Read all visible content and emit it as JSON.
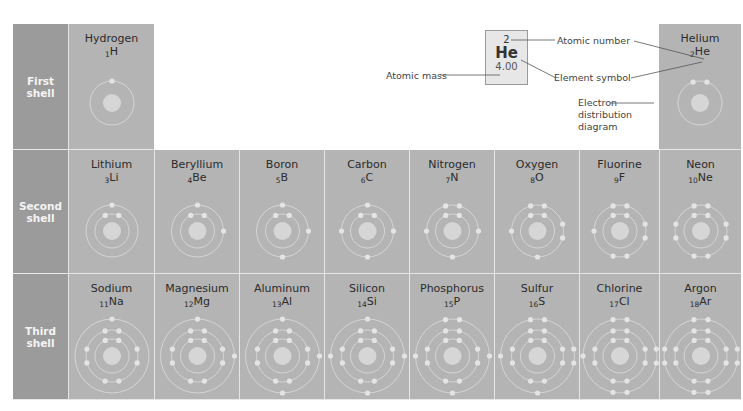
{
  "rows": [
    {
      "label": "First\nshell",
      "label_lines": [
        "First",
        "shell"
      ]
    },
    {
      "label": "Second\nshell",
      "label_lines": [
        "Second",
        "shell"
      ]
    },
    {
      "label": "Third\nshell",
      "label_lines": [
        "Third",
        "shell"
      ]
    }
  ],
  "elements": [
    {
      "name": "Hydrogen",
      "number": "1",
      "symbol": "H",
      "shells": [
        1
      ],
      "row": 0,
      "col": 0
    },
    {
      "name": "Helium",
      "number": "2",
      "symbol": "He",
      "shells": [
        2
      ],
      "row": 0,
      "col": 7
    },
    {
      "name": "Lithium",
      "number": "3",
      "symbol": "Li",
      "shells": [
        2,
        1
      ],
      "row": 1,
      "col": 0
    },
    {
      "name": "Beryllium",
      "number": "4",
      "symbol": "Be",
      "shells": [
        2,
        2
      ],
      "row": 1,
      "col": 1
    },
    {
      "name": "Boron",
      "number": "5",
      "symbol": "B",
      "shells": [
        2,
        3
      ],
      "row": 1,
      "col": 2
    },
    {
      "name": "Carbon",
      "number": "6",
      "symbol": "C",
      "shells": [
        2,
        4
      ],
      "row": 1,
      "col": 3
    },
    {
      "name": "Nitrogen",
      "number": "7",
      "symbol": "N",
      "shells": [
        2,
        5
      ],
      "row": 1,
      "col": 4
    },
    {
      "name": "Oxygen",
      "number": "8",
      "symbol": "O",
      "shells": [
        2,
        6
      ],
      "row": 1,
      "col": 5
    },
    {
      "name": "Fluorine",
      "number": "9",
      "symbol": "F",
      "shells": [
        2,
        7
      ],
      "row": 1,
      "col": 6
    },
    {
      "name": "Neon",
      "number": "10",
      "symbol": "Ne",
      "shells": [
        2,
        8
      ],
      "row": 1,
      "col": 7
    },
    {
      "name": "Sodium",
      "number": "11",
      "symbol": "Na",
      "shells": [
        2,
        8,
        1
      ],
      "row": 2,
      "col": 0
    },
    {
      "name": "Magnesium",
      "number": "12",
      "symbol": "Mg",
      "shells": [
        2,
        8,
        2
      ],
      "row": 2,
      "col": 1
    },
    {
      "name": "Aluminum",
      "number": "13",
      "symbol": "Al",
      "shells": [
        2,
        8,
        3
      ],
      "row": 2,
      "col": 2
    },
    {
      "name": "Silicon",
      "number": "14",
      "symbol": "Si",
      "shells": [
        2,
        8,
        4
      ],
      "row": 2,
      "col": 3
    },
    {
      "name": "Phosphorus",
      "number": "15",
      "symbol": "P",
      "shells": [
        2,
        8,
        5
      ],
      "row": 2,
      "col": 4
    },
    {
      "name": "Sulfur",
      "number": "16",
      "symbol": "S",
      "shells": [
        2,
        8,
        6
      ],
      "row": 2,
      "col": 5
    },
    {
      "name": "Chlorine",
      "number": "17",
      "symbol": "Cl",
      "shells": [
        2,
        8,
        7
      ],
      "row": 2,
      "col": 6
    },
    {
      "name": "Argon",
      "number": "18",
      "symbol": "Ar",
      "shells": [
        2,
        8,
        8
      ],
      "row": 2,
      "col": 7
    }
  ],
  "key": {
    "atomic_number": "2",
    "symbol": "He",
    "atomic_mass": "4.00",
    "labels": {
      "atomic_number": "Atomic number",
      "element_symbol": "Element symbol",
      "atomic_mass": "Atomic mass",
      "electron_diagram": [
        "Electron",
        "distribution",
        "diagram"
      ]
    }
  },
  "colors": {
    "row_label_bg": "#9b9b9b",
    "cell_bg": "#b4b4b4",
    "nucleus": "#d6d6d6",
    "shell_line": "#dcdcdc",
    "electron": "#e4e4e4"
  }
}
